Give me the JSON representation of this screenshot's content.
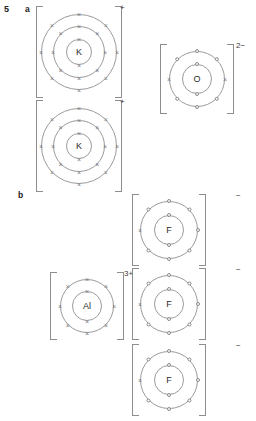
{
  "question": {
    "number": "5",
    "parts": [
      {
        "label": "a"
      },
      {
        "label": "b"
      }
    ]
  },
  "diagram": {
    "type": "dot-and-cross electron shell diagrams of ions",
    "marker_legend": {
      "cross": "×",
      "dot": "o"
    },
    "groups": [
      {
        "part": "a",
        "compound": "K2O",
        "ions": [
          {
            "symbol": "K",
            "charge": "+",
            "shells": [
              {
                "electrons": 2,
                "marker": "cross"
              },
              {
                "electrons": 8,
                "marker": "cross"
              },
              {
                "electrons": 8,
                "marker": "cross"
              }
            ]
          },
          {
            "symbol": "K",
            "charge": "+",
            "shells": [
              {
                "electrons": 2,
                "marker": "cross"
              },
              {
                "electrons": 8,
                "marker": "cross"
              },
              {
                "electrons": 8,
                "marker": "cross"
              }
            ]
          },
          {
            "symbol": "O",
            "charge": "2−",
            "shells": [
              {
                "electrons": 2,
                "marker": "dot"
              },
              {
                "electrons": 8,
                "marker": "mixed",
                "pattern": [
                  "dot",
                  "dot",
                  "cross",
                  "dot",
                  "dot",
                  "dot",
                  "cross",
                  "dot"
                ]
              }
            ]
          }
        ]
      },
      {
        "part": "b",
        "compound": "AlF3",
        "ions": [
          {
            "symbol": "Al",
            "charge": "3+",
            "shells": [
              {
                "electrons": 2,
                "marker": "cross"
              },
              {
                "electrons": 8,
                "marker": "cross"
              }
            ]
          },
          {
            "symbol": "F",
            "charge": "−",
            "shells": [
              {
                "electrons": 2,
                "marker": "dot"
              },
              {
                "electrons": 8,
                "marker": "mixed",
                "pattern": [
                  "dot",
                  "dot",
                  "dot",
                  "dot",
                  "dot",
                  "dot",
                  "cross",
                  "dot"
                ]
              }
            ]
          },
          {
            "symbol": "F",
            "charge": "−",
            "shells": [
              {
                "electrons": 2,
                "marker": "dot"
              },
              {
                "electrons": 8,
                "marker": "mixed",
                "pattern": [
                  "dot",
                  "dot",
                  "dot",
                  "dot",
                  "dot",
                  "dot",
                  "cross",
                  "dot"
                ]
              }
            ]
          },
          {
            "symbol": "F",
            "charge": "−",
            "shells": [
              {
                "electrons": 2,
                "marker": "dot"
              },
              {
                "electrons": 8,
                "marker": "mixed",
                "pattern": [
                  "dot",
                  "dot",
                  "dot",
                  "dot",
                  "dot",
                  "dot",
                  "cross",
                  "dot"
                ]
              }
            ]
          }
        ]
      }
    ]
  },
  "colors": {
    "ink": "#1a1a1a",
    "line": "#9b9b9b",
    "bracket": "#8d8d8d",
    "marker": "#7d7d7d",
    "background": "#ffffff"
  }
}
